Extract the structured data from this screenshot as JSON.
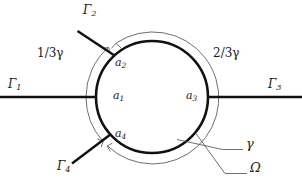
{
  "figure": {
    "colors": {
      "stroke_thick": "#111111",
      "stroke_thin": "#4a4a4a",
      "text": "#1a1a1a",
      "background": "#ffffff"
    },
    "geometry": {
      "circle_center_x": 152,
      "circle_center_y": 97,
      "circle_radius": 56,
      "outer_arc_radius": 66,
      "thick_stroke_width": 2.6,
      "thin_stroke_width": 0.8
    }
  },
  "edges": [
    {
      "name": "gamma-1",
      "label": "Γ",
      "sub": "1",
      "direction": "west",
      "angle_deg": 180
    },
    {
      "name": "gamma-2",
      "label": "Γ",
      "sub": "2",
      "direction": "northwest",
      "angle_deg": 132
    },
    {
      "name": "gamma-3",
      "label": "Γ",
      "sub": "3",
      "direction": "east",
      "angle_deg": 0
    },
    {
      "name": "gamma-4",
      "label": "Γ",
      "sub": "4",
      "direction": "southwest",
      "angle_deg": 222
    }
  ],
  "nodes": [
    {
      "name": "a-1",
      "label": "a",
      "sub": "1",
      "position": "left-interior"
    },
    {
      "name": "a-2",
      "label": "a",
      "sub": "2",
      "position": "top-interior"
    },
    {
      "name": "a-3",
      "label": "a",
      "sub": "3",
      "position": "right-interior"
    },
    {
      "name": "a-4",
      "label": "a",
      "sub": "4",
      "position": "bottom-left-interior"
    }
  ],
  "arc_labels": [
    {
      "name": "one-third-gamma",
      "numerator": "1",
      "denominator": "3",
      "symbol": "γ",
      "text": "1/3γ",
      "position": "upper-left"
    },
    {
      "name": "two-thirds-gamma",
      "numerator": "2",
      "denominator": "3",
      "symbol": "γ",
      "text": "2/3γ",
      "position": "upper-right"
    }
  ],
  "leader_labels": [
    {
      "name": "gamma-boundary",
      "text": "γ",
      "description": "circle boundary curve"
    },
    {
      "name": "omega-domain",
      "text": "Ω",
      "description": "domain interior"
    }
  ]
}
